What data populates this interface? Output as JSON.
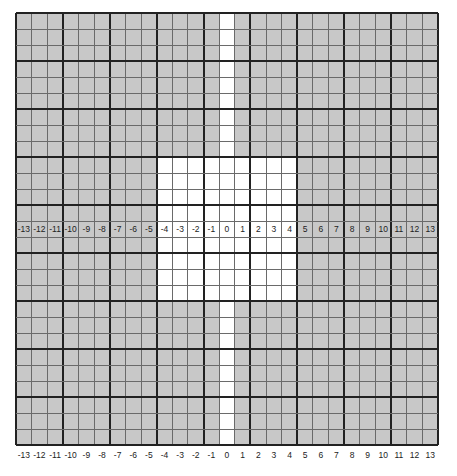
{
  "grid": {
    "columns": 27,
    "rows": 27,
    "major_every": 3,
    "shaded_color": "#c8c8c8",
    "white_color": "#ffffff",
    "minor_line_color": "#6a6a6a",
    "major_line_color": "#222222",
    "white_column_index": 13,
    "white_center_block": {
      "col_start": 9,
      "col_end": 17,
      "row_start": 9,
      "row_end": 17
    },
    "label_row_index": 13
  },
  "middle_labels": [
    "-13",
    "-12",
    "-11",
    "-10",
    "-9",
    "-8",
    "-7",
    "-6",
    "-5",
    "-4",
    "-3",
    "-2",
    "-1",
    "0",
    "1",
    "2",
    "3",
    "4",
    "5",
    "6",
    "7",
    "8",
    "9",
    "10",
    "11",
    "12",
    "13"
  ],
  "bottom_labels": [
    "-13",
    "-12",
    "-11",
    "-10",
    "-9",
    "-8",
    "-7",
    "-6",
    "-5",
    "-4",
    "-3",
    "-2",
    "-1",
    "0",
    "1",
    "2",
    "3",
    "4",
    "5",
    "6",
    "7",
    "8",
    "9",
    "10",
    "11",
    "12",
    "13"
  ]
}
